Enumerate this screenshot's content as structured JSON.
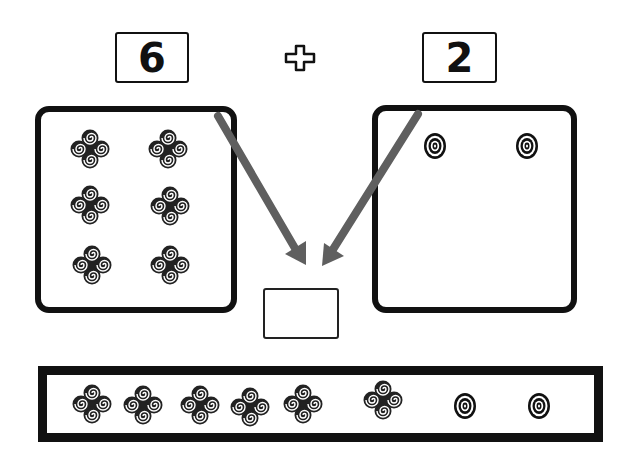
{
  "problem": {
    "addend_a": "6",
    "operator": "+",
    "addend_b": "2",
    "answer": ""
  },
  "groups": {
    "a": {
      "count": 6,
      "item_icon": "swirl-cluster-icon"
    },
    "b": {
      "count": 2,
      "item_icon": "concentric-circle-icon"
    }
  },
  "total_bar": {
    "items": [
      "swirl-cluster-icon",
      "swirl-cluster-icon",
      "swirl-cluster-icon",
      "swirl-cluster-icon",
      "swirl-cluster-icon",
      "swirl-cluster-icon",
      "concentric-circle-icon",
      "concentric-circle-icon"
    ]
  },
  "colors": {
    "ink": "#111111",
    "arrow": "#5f5f5f",
    "background": "#ffffff"
  }
}
